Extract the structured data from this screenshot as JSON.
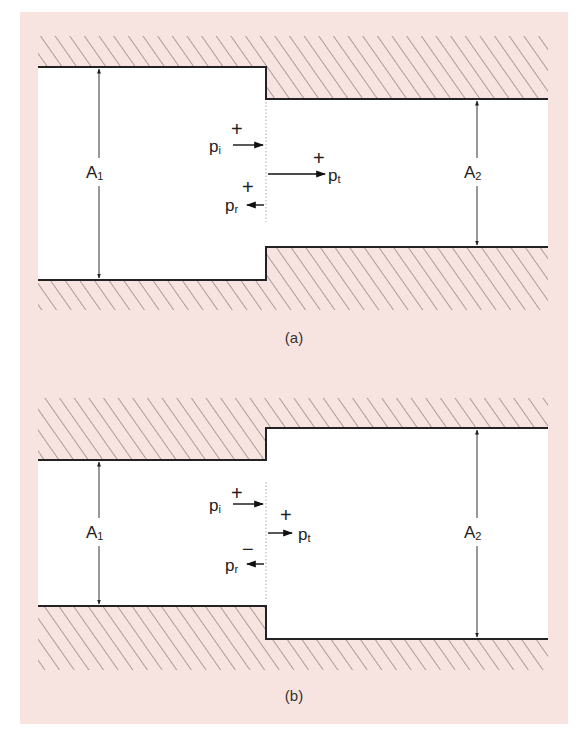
{
  "colors": {
    "panel_bg": "#f7e3df",
    "duct_interior": "#ffffff",
    "wall_line": "#222222",
    "hatch": "#6b6160"
  },
  "figures": [
    {
      "id": "a",
      "caption": "(a)",
      "description": "Area contraction: A2 < A1",
      "area_labels": {
        "left": {
          "main": "A",
          "sub": "1"
        },
        "right": {
          "main": "A",
          "sub": "2"
        }
      },
      "waves": {
        "incident": {
          "main": "p",
          "sub": "i",
          "sign": "+",
          "direction": "right"
        },
        "transmitted": {
          "main": "p",
          "sub": "t",
          "sign": "+",
          "direction": "right"
        },
        "reflected": {
          "main": "p",
          "sub": "r",
          "sign": "+",
          "direction": "left"
        }
      }
    },
    {
      "id": "b",
      "caption": "(b)",
      "description": "Area expansion: A2 > A1",
      "area_labels": {
        "left": {
          "main": "A",
          "sub": "1"
        },
        "right": {
          "main": "A",
          "sub": "2"
        }
      },
      "waves": {
        "incident": {
          "main": "p",
          "sub": "i",
          "sign": "+",
          "direction": "right"
        },
        "transmitted": {
          "main": "p",
          "sub": "t",
          "sign": "+",
          "direction": "right"
        },
        "reflected": {
          "main": "p",
          "sub": "r",
          "sign": "−",
          "direction": "left"
        }
      }
    }
  ]
}
